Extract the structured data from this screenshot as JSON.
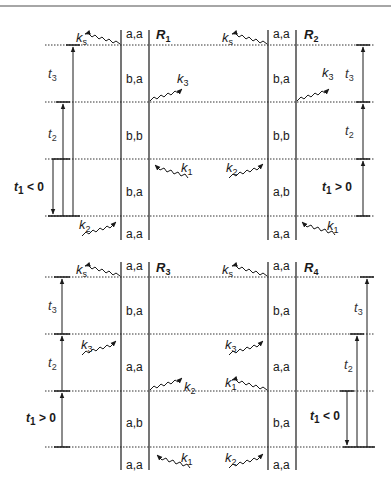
{
  "figure": {
    "top_rule": true,
    "panels": [
      {
        "id": "R1",
        "label": "R",
        "label_sub": "1",
        "states": [
          "a,a",
          "b,a",
          "b,b",
          "b,a",
          "a,a"
        ],
        "interactions": [
          {
            "name": "k",
            "sub": "s",
            "side": "left-out",
            "level": 0
          },
          {
            "name": "k",
            "sub": "3",
            "side": "right-out",
            "level": 1
          },
          {
            "name": "k",
            "sub": "1",
            "side": "right-in",
            "level": 2
          },
          {
            "name": "k",
            "sub": "2",
            "side": "left-in",
            "level": 3
          }
        ],
        "delays": [
          {
            "label": "t",
            "sub": "3",
            "from": 3,
            "to": 0
          },
          {
            "label": "t",
            "sub": "2",
            "from": 3,
            "to": 1
          },
          {
            "label": "t",
            "sub": "1",
            "text": " < 0",
            "from": 2,
            "to": 3
          }
        ]
      },
      {
        "id": "R2",
        "label": "R",
        "label_sub": "2",
        "states": [
          "a,a",
          "b,a",
          "b,b",
          "a,b",
          "a,a"
        ],
        "interactions": [
          {
            "name": "k",
            "sub": "s",
            "side": "left-out",
            "level": 0
          },
          {
            "name": "k",
            "sub": "3",
            "side": "right-out",
            "level": 1
          },
          {
            "name": "k",
            "sub": "2",
            "side": "left-in",
            "level": 2
          },
          {
            "name": "k",
            "sub": "1",
            "side": "right-in",
            "level": 3
          }
        ],
        "delays": [
          {
            "label": "t",
            "sub": "3",
            "from": 1,
            "to": 0
          },
          {
            "label": "t",
            "sub": "2",
            "from": 2,
            "to": 1
          },
          {
            "label": "t",
            "sub": "1",
            "text": " > 0",
            "from": 3,
            "to": 2
          }
        ]
      },
      {
        "id": "R3",
        "label": "R",
        "label_sub": "3",
        "states": [
          "a,a",
          "b,a",
          "a,a",
          "a,b",
          "a,a"
        ],
        "interactions": [
          {
            "name": "k",
            "sub": "s",
            "side": "left-out",
            "level": 0
          },
          {
            "name": "k",
            "sub": "3",
            "side": "left-in",
            "level": 1
          },
          {
            "name": "k",
            "sub": "2",
            "side": "right-out",
            "level": 2
          },
          {
            "name": "k",
            "sub": "1",
            "side": "right-in",
            "level": 3
          }
        ],
        "delays": [
          {
            "label": "t",
            "sub": "3",
            "from": 1,
            "to": 0
          },
          {
            "label": "t",
            "sub": "2",
            "from": 2,
            "to": 1
          },
          {
            "label": "t",
            "sub": "1",
            "text": " > 0",
            "from": 3,
            "to": 2
          }
        ]
      },
      {
        "id": "R4",
        "label": "R",
        "label_sub": "4",
        "states": [
          "a,a",
          "b,a",
          "a,a",
          "b,a",
          "a,a"
        ],
        "interactions": [
          {
            "name": "k",
            "sub": "s",
            "side": "left-out",
            "level": 0
          },
          {
            "name": "k",
            "sub": "3",
            "side": "left-in",
            "level": 1
          },
          {
            "name": "k",
            "sub": "1",
            "side": "left-out",
            "level": 2
          },
          {
            "name": "k",
            "sub": "2",
            "side": "left-in",
            "level": 3
          }
        ],
        "delays": [
          {
            "label": "t",
            "sub": "3",
            "from": 3,
            "to": 0
          },
          {
            "label": "t",
            "sub": "2",
            "from": 3,
            "to": 1
          },
          {
            "label": "t",
            "sub": "1",
            "text": " < 0",
            "from": 2,
            "to": 3
          }
        ]
      }
    ]
  },
  "labels": {
    "r1": {
      "main": "R",
      "sub": "1"
    },
    "r2": {
      "main": "R",
      "sub": "2"
    },
    "r3": {
      "main": "R",
      "sub": "3"
    },
    "r4": {
      "main": "R",
      "sub": "4"
    },
    "states": {
      "r1": [
        "a,a",
        "b,a",
        "b,b",
        "b,a",
        "a,a"
      ],
      "r2": [
        "a,a",
        "b,a",
        "b,b",
        "a,b",
        "a,a"
      ],
      "r3": [
        "a,a",
        "b,a",
        "a,a",
        "a,b",
        "a,a"
      ],
      "r4": [
        "a,a",
        "b,a",
        "a,a",
        "b,a",
        "a,a"
      ]
    },
    "k": {
      "main": "k",
      "s": "s",
      "one": "1",
      "two": "2",
      "three": "3"
    },
    "t": {
      "main": "t",
      "one": "1",
      "two": "2",
      "three": "3",
      "lt0": " < 0",
      "gt0": " > 0"
    }
  }
}
